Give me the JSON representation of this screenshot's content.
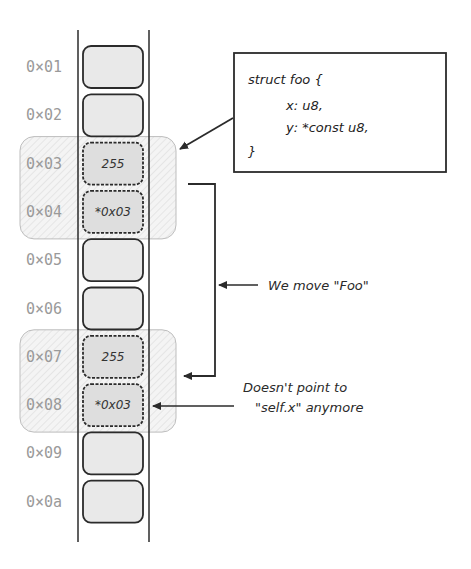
{
  "memory": {
    "cells": [
      {
        "address": "0x01",
        "value": "",
        "highlighted": false
      },
      {
        "address": "0x02",
        "value": "",
        "highlighted": false
      },
      {
        "address": "0x03",
        "value": "255",
        "highlighted": true
      },
      {
        "address": "0x04",
        "value": "*0x03",
        "highlighted": true
      },
      {
        "address": "0x05",
        "value": "",
        "highlighted": false
      },
      {
        "address": "0x06",
        "value": "",
        "highlighted": false
      },
      {
        "address": "0x07",
        "value": "255",
        "highlighted": true
      },
      {
        "address": "0x08",
        "value": "*0x03",
        "highlighted": true
      },
      {
        "address": "0x09",
        "value": "",
        "highlighted": false
      },
      {
        "address": "0x0a",
        "value": "",
        "highlighted": false
      }
    ],
    "groups": [
      {
        "name": "original-foo",
        "from": "0x03",
        "to": "0x04"
      },
      {
        "name": "moved-foo",
        "from": "0x07",
        "to": "0x08"
      }
    ]
  },
  "struct_box": {
    "lines": [
      "struct foo {",
      "x: u8,",
      "y: *const u8,",
      "}"
    ]
  },
  "annotations": {
    "move_label": "We move \"Foo\"",
    "stale_pointer_line1": "Doesn't point to",
    "stale_pointer_line2": "\"self.x\" anymore"
  },
  "colors": {
    "cell_fill": "#e9e9e9",
    "group_fill": "#f2f2f2",
    "stroke": "#2b2b2b",
    "address_text": "#9a9a9a"
  }
}
